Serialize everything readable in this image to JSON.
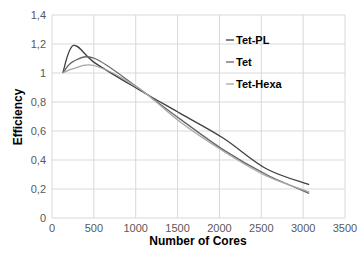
{
  "chart_data": {
    "type": "line",
    "title": "",
    "xlabel": "Number of Cores",
    "ylabel": "Efficiency",
    "xlim": [
      0,
      3500
    ],
    "ylim": [
      0,
      1.4
    ],
    "xticks": [
      "0",
      "500",
      "1000",
      "1500",
      "2000",
      "2500",
      "3000",
      "3500"
    ],
    "yticks": [
      "0",
      "0,2",
      "0,4",
      "0,6",
      "0,8",
      "1",
      "1,2",
      "1,4"
    ],
    "grid": true,
    "legend_position": "upper right inside",
    "series": [
      {
        "name": "Tet-PL",
        "color": "#404040",
        "x": [
          128,
          256,
          512,
          1024,
          1536,
          2048,
          2560,
          3072
        ],
        "y": [
          1.0,
          1.19,
          1.07,
          0.89,
          0.72,
          0.55,
          0.34,
          0.23
        ]
      },
      {
        "name": "Tet",
        "color": "#666666",
        "x": [
          128,
          256,
          512,
          1024,
          1536,
          2048,
          2560,
          3072
        ],
        "y": [
          1.0,
          1.08,
          1.1,
          0.9,
          0.68,
          0.47,
          0.3,
          0.17
        ]
      },
      {
        "name": "Tet-Hexa",
        "color": "#a6a6a6",
        "x": [
          128,
          256,
          512,
          1024,
          1536,
          2048,
          2560,
          3072
        ],
        "y": [
          1.0,
          1.03,
          1.05,
          0.9,
          0.66,
          0.46,
          0.29,
          0.18
        ]
      }
    ]
  }
}
